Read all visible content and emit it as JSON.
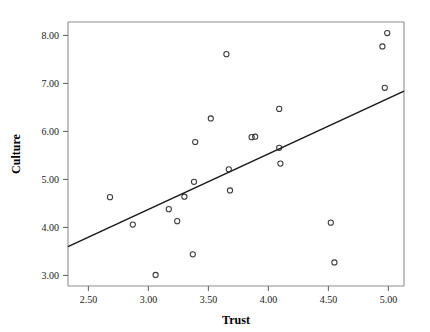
{
  "chart_data": {
    "type": "scatter",
    "title": "",
    "xlabel": "Trust",
    "ylabel": "Culture",
    "xlim": [
      2.33,
      5.13
    ],
    "ylim": [
      2.78,
      8.28
    ],
    "xticks": [
      2.5,
      3.0,
      3.5,
      4.0,
      4.5,
      5.0
    ],
    "xtick_labels": [
      "2.50",
      "3.00",
      "3.50",
      "4.00",
      "4.50",
      "5.00"
    ],
    "yticks": [
      3.0,
      4.0,
      5.0,
      6.0,
      7.0,
      8.0
    ],
    "ytick_labels": [
      "3.00",
      "4.00",
      "5.00",
      "6.00",
      "7.00",
      "8.00"
    ],
    "grid": false,
    "legend": null,
    "marker": {
      "shape": "circle-open",
      "radius": 2.6,
      "stroke_color": "#3a3a3a"
    },
    "points": [
      {
        "x": 2.68,
        "y": 4.63
      },
      {
        "x": 2.87,
        "y": 4.06
      },
      {
        "x": 3.06,
        "y": 3.01
      },
      {
        "x": 3.17,
        "y": 4.38
      },
      {
        "x": 3.24,
        "y": 4.13
      },
      {
        "x": 3.3,
        "y": 4.64
      },
      {
        "x": 3.37,
        "y": 3.44
      },
      {
        "x": 3.38,
        "y": 4.95
      },
      {
        "x": 3.39,
        "y": 5.78
      },
      {
        "x": 3.52,
        "y": 6.27
      },
      {
        "x": 3.65,
        "y": 7.61
      },
      {
        "x": 3.67,
        "y": 5.21
      },
      {
        "x": 3.68,
        "y": 4.77
      },
      {
        "x": 3.86,
        "y": 5.88
      },
      {
        "x": 3.89,
        "y": 5.89
      },
      {
        "x": 4.09,
        "y": 6.47
      },
      {
        "x": 4.09,
        "y": 5.66
      },
      {
        "x": 4.1,
        "y": 5.33
      },
      {
        "x": 4.52,
        "y": 4.1
      },
      {
        "x": 4.55,
        "y": 3.27
      },
      {
        "x": 4.95,
        "y": 7.77
      },
      {
        "x": 4.97,
        "y": 6.91
      },
      {
        "x": 4.99,
        "y": 8.05
      }
    ],
    "fit_line": {
      "type": "linear",
      "x_start": 2.33,
      "y_start": 3.6,
      "x_end": 5.13,
      "y_end": 6.84,
      "color": "#1a1a1a"
    },
    "axis_color": "#8d8d8d",
    "background_color": "#ffffff"
  }
}
